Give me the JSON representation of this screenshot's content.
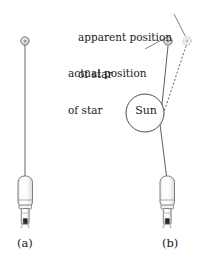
{
  "figure": {
    "type": "physics-diagram",
    "background_color": "#ffffff",
    "line_color": "#555555",
    "text_color": "#1a1a1a",
    "telescope_fill": "#f2f2f2",
    "star_fill": "#d8d8d8"
  },
  "labels": {
    "apparent_position_line1": "apparent position",
    "apparent_position_line2": "of star",
    "actual_position_line1": "actual position",
    "actual_position_line2": "of star",
    "sun": "Sun",
    "panel_a": "(a)",
    "panel_b": "(b)"
  },
  "panels": [
    {
      "id": "a",
      "caption": "(a)",
      "star": {
        "name": "star",
        "x": 25,
        "y": 41,
        "r": 4
      },
      "telescope": {
        "name": "telescope",
        "x": 25,
        "y_top": 175,
        "y_bottom": 228
      },
      "sight_line": {
        "from": [
          25,
          45
        ],
        "to": [
          25,
          175
        ],
        "style": "solid"
      },
      "sun_present": false
    },
    {
      "id": "b",
      "caption": "(b)",
      "actual_star": {
        "name": "actual-star",
        "x": 168,
        "y": 41,
        "r": 4
      },
      "apparent_star": {
        "name": "apparent-star",
        "x": 187,
        "y": 41,
        "r": 4
      },
      "sun": {
        "name": "sun",
        "cx": 145,
        "cy": 113,
        "r": 19
      },
      "telescope": {
        "name": "telescope",
        "x": 167,
        "y_top": 175,
        "y_bottom": 228
      },
      "deflected_ray": {
        "points": [
          [
            168,
            45
          ],
          [
            160,
            124
          ],
          [
            167,
            175
          ]
        ],
        "style": "solid"
      },
      "apparent_ray": {
        "points": [
          [
            186,
            46
          ],
          [
            160,
            124
          ]
        ],
        "style": "dotted"
      },
      "sun_present": true
    }
  ],
  "leader_lines": [
    {
      "name": "apparent-leader",
      "from": [
        174,
        14
      ],
      "to": [
        185,
        36
      ]
    },
    {
      "name": "actual-leader",
      "from": [
        146,
        48
      ],
      "to": [
        163,
        39
      ]
    }
  ]
}
